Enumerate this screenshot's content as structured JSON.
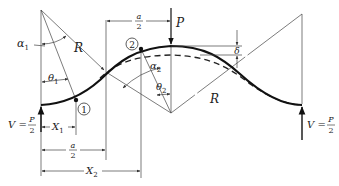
{
  "figure": {
    "type": "structural-mechanics diagram",
    "labels": {
      "alpha1": "α",
      "alpha1_sub": "1",
      "alpha2": "α",
      "alpha2_sub": "2",
      "theta1": "θ",
      "theta1_sub": "1",
      "theta2": "θ",
      "theta2_sub": "2",
      "R_left": "R",
      "R_right": "R",
      "P": "P",
      "delta": "δ",
      "point1": "1",
      "point2": "2",
      "X1": "X",
      "X1_sub": "1",
      "X2": "X",
      "X2_sub": "2",
      "a_over_2_top_num": "a",
      "a_over_2_top_den": "2",
      "a_over_2_bottom_num": "a",
      "a_over_2_bottom_den": "2",
      "V_left": "V =",
      "V_left_num": "P",
      "V_left_den": "2",
      "V_right": "V =",
      "V_right_num": "P",
      "V_right_den": "2"
    },
    "legend": {
      "solid_curve": "deflected shape",
      "dashed_curve": "original shape"
    }
  }
}
